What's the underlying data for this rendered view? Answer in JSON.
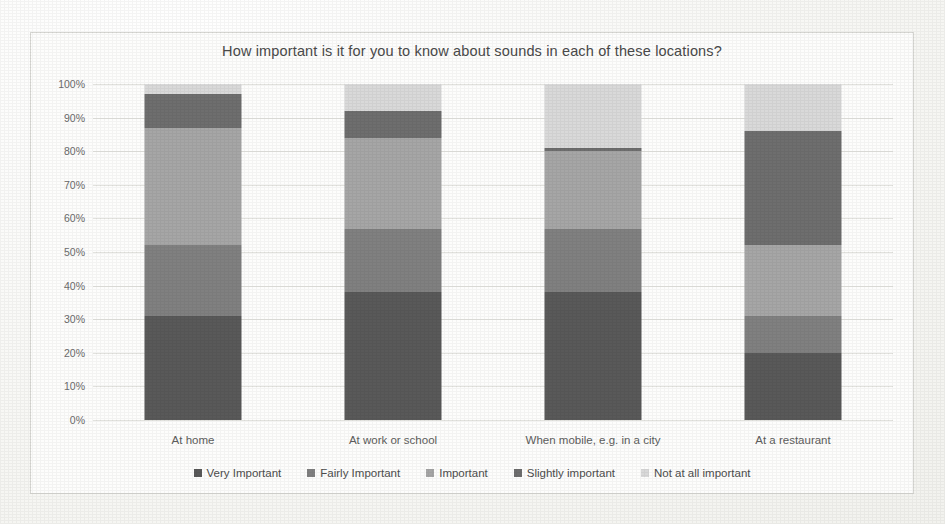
{
  "chart_data": {
    "type": "bar",
    "subtype": "stacked-bar-100-percent",
    "title": "How important is it for you to know about sounds in each of these locations?",
    "xlabel": "",
    "ylabel": "",
    "ylim": [
      0,
      100
    ],
    "grid": true,
    "legend_position": "bottom",
    "categories": [
      "At home",
      "At work or school",
      "When mobile, e.g. in a city",
      "At a restaurant"
    ],
    "ytick_labels": [
      "0%",
      "10%",
      "20%",
      "30%",
      "40%",
      "50%",
      "60%",
      "70%",
      "80%",
      "90%",
      "100%"
    ],
    "ytick_values": [
      0,
      10,
      20,
      30,
      40,
      50,
      60,
      70,
      80,
      90,
      100
    ],
    "series": [
      {
        "name": "Very Important",
        "color": "#595959",
        "values": [
          31,
          38,
          38,
          20
        ]
      },
      {
        "name": "Fairly Important",
        "color": "#808080",
        "values": [
          21,
          19,
          19,
          11
        ]
      },
      {
        "name": "Important",
        "color": "#a6a6a6",
        "values": [
          35,
          27,
          23,
          21
        ]
      },
      {
        "name": "Slightly important",
        "color": "#6e6e6e",
        "values": [
          10,
          8,
          1,
          34
        ]
      },
      {
        "name": "Not at all important",
        "color": "#d9d9d9",
        "values": [
          3,
          8,
          19,
          14
        ]
      }
    ]
  }
}
